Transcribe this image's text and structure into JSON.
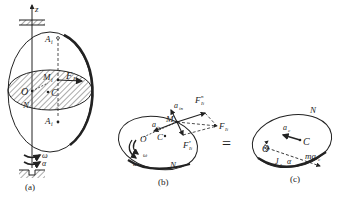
{
  "figure": {
    "background": "#ffffff",
    "ink_color": "#222222",
    "panels": [
      {
        "id": "a",
        "caption": "(a)",
        "labels": {
          "axis": "z",
          "point_A1": "A",
          "point_A1_sub": "i",
          "force": "F",
          "force_sub": "Ii",
          "point_M": "M",
          "point_M_sub": "i",
          "origin": "O",
          "center": "C",
          "plane": "N",
          "point_A1p": "A",
          "point_A1p_sub": "i",
          "omega": "ω",
          "alpha": "α"
        }
      },
      {
        "id": "b",
        "caption": "(b)",
        "labels": {
          "a_n": "a",
          "a_n_sub": "in",
          "a_t": "a",
          "a_t_sub": "iτ",
          "point_M": "M",
          "point_M_sub": "i",
          "F_n": "F",
          "F_n_sub": "Ii",
          "F_n_sup": "n",
          "F_t": "F",
          "F_t_sub": "Ii",
          "F_t_sup": "τ",
          "F": "F",
          "F_sub": "Ii",
          "origin": "O",
          "center": "C",
          "omega": "ω",
          "alpha": "α",
          "plane": "N"
        }
      },
      {
        "equals": "="
      },
      {
        "id": "c",
        "caption": "(c)",
        "labels": {
          "plane": "N",
          "a_c": "a",
          "a_c_sub": "c",
          "center": "C",
          "origin": "O",
          "ma_c": "ma",
          "ma_c_sub": "c",
          "moment": "J",
          "moment_sub": "z",
          "moment_alpha": "α"
        }
      }
    ]
  }
}
